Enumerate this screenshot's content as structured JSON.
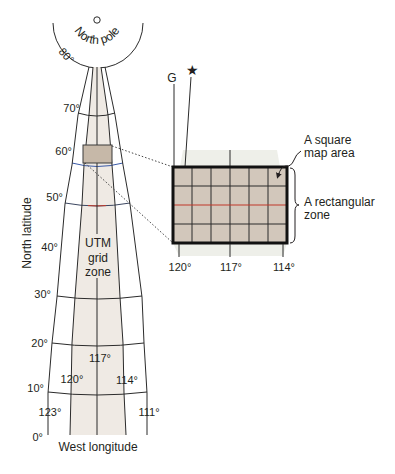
{
  "pole": {
    "label": "North pole",
    "latitude_80": "80°"
  },
  "latitude_labels": {
    "lat_70": "70°",
    "lat_60": "60°",
    "lat_50": "50°",
    "lat_40": "40°",
    "lat_30": "30°",
    "lat_20": "20°",
    "lat_10": "10°",
    "lat_0": "0°"
  },
  "longitude_labels": {
    "lon_123": "123°",
    "lon_120": "120°",
    "lon_117": "117°",
    "lon_114": "114°",
    "lon_111": "111°"
  },
  "axes": {
    "y_label": "North latitude",
    "x_label": "West longitude"
  },
  "zone_label": {
    "line1": "UTM",
    "line2": "grid",
    "line3": "zone"
  },
  "inset": {
    "grid_north_label": "G",
    "true_north_symbol": "★",
    "bottom_labels": {
      "left": "120°",
      "middle": "117°",
      "right": "114°"
    },
    "square_annotation": {
      "line1": "A square",
      "line2": "map area"
    },
    "zone_annotation": {
      "line1": "A rectangular",
      "line2": "zone"
    },
    "grid": {
      "columns": 6,
      "rows": 4
    }
  },
  "colors": {
    "zone_strip": "#efeae4",
    "map_area_fill": "#d2c7bb",
    "small_area_fill": "#c6b8a8",
    "latitude_60_line": "#3a5aa8",
    "center_latitude_line": "#c0392b",
    "line": "#2b2b2b"
  }
}
